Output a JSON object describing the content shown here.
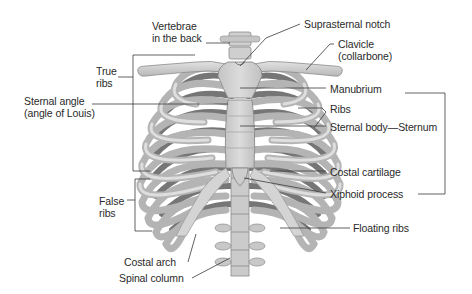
{
  "figure": {
    "colors": {
      "background": "#ffffff",
      "bone_light": "#d6d6d6",
      "bone_mid": "#bdbdbd",
      "bone_shadow": "#6e6e6e",
      "rib_back": "#7a7a7a",
      "leader_line": "#3a3a3a",
      "text": "#2a2a2a"
    }
  },
  "labels": {
    "vertebrae_back": [
      "Vertebrae",
      "in the back"
    ],
    "suprasternal_notch": "Suprasternal notch",
    "clavicle": [
      "Clavicle",
      "(collarbone)"
    ],
    "true_ribs": [
      "True",
      "ribs"
    ],
    "sternal_angle": [
      "Sternal angle",
      "(angle of Louis)"
    ],
    "manubrium": "Manubrium",
    "ribs": "Ribs",
    "sternal_body": "Sternal body—Sternum",
    "costal_cartilage": "Costal cartilage",
    "xiphoid_process": "Xiphoid process",
    "false_ribs": [
      "False",
      "ribs"
    ],
    "floating_ribs": "Floating ribs",
    "costal_arch": "Costal arch",
    "spinal_column": "Spinal column"
  },
  "brackets": {
    "true_ribs": "left bracket spanning ribs 1-7",
    "false_ribs": "left bracket spanning ribs 8-10",
    "sternum": "right bracket grouping Manubrium, Sternal body, Xiphoid process"
  }
}
